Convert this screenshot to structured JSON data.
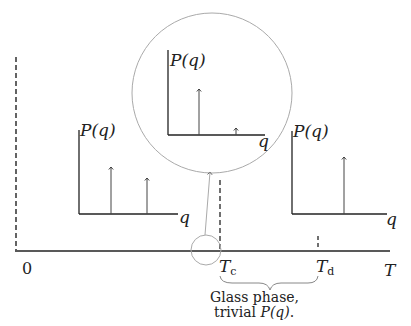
{
  "figure": {
    "axis": {
      "label": "T",
      "origin_label": "0"
    },
    "temperatures": {
      "tc": {
        "main": "T",
        "sub": "c"
      },
      "td": {
        "main": "T",
        "sub": "d"
      }
    },
    "brace_annotation": {
      "line1": "Glass phase,",
      "line2_prefix": "trivial ",
      "line2_math": "P(q)",
      "line2_suffix": "."
    },
    "insets": [
      {
        "id": "low-T",
        "ylabel": "P(q)",
        "xlabel": "q",
        "peaks": [
          "medium",
          "medium-small"
        ]
      },
      {
        "id": "zoom-Tc",
        "ylabel": "P(q)",
        "xlabel": "q",
        "peaks": [
          "tall",
          "tiny"
        ]
      },
      {
        "id": "high-T",
        "ylabel": "P(q)",
        "xlabel": "q",
        "peaks": [
          "single"
        ]
      }
    ]
  }
}
